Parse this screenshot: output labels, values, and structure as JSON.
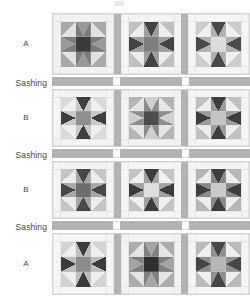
{
  "diagram": {
    "labels": {
      "row_a": "A",
      "row_b": "B",
      "sashing": "Sashing"
    },
    "rows": [
      {
        "type": "block",
        "label": "A",
        "blocks": 3
      },
      {
        "type": "sashing",
        "label": "Sashing",
        "cornerstones": 2
      },
      {
        "type": "block",
        "label": "B",
        "blocks": 3
      },
      {
        "type": "sashing",
        "label": "Sashing",
        "cornerstones": 2
      },
      {
        "type": "block",
        "label": "B",
        "blocks": 3
      },
      {
        "type": "sashing",
        "label": "Sashing",
        "cornerstones": 2
      },
      {
        "type": "block",
        "label": "A",
        "blocks": 3
      }
    ],
    "colors": {
      "sashing": "#b3b3b3",
      "cornerstone": "#ffffff",
      "background": "#ffffff",
      "outline": "#d2d2d2",
      "label_text": "#4a4a4a",
      "very_dark": "#3a3a3a",
      "dark": "#4f4f4f",
      "medium_dark": "#6e6e6e",
      "medium": "#8a8a8a",
      "medium_light": "#a8a8a8",
      "light": "#c6c6c6",
      "very_light": "#dedede",
      "near_white": "#efefef"
    },
    "block_structure": {
      "grid": "4x4 nine-patch star",
      "parts": [
        "center-square",
        "star-points",
        "corner-squares",
        "background-triangles"
      ]
    },
    "block_palettes": [
      {
        "row": "A",
        "index": 0,
        "center": "#3a3a3a",
        "points": "#7b7b7b",
        "corners": "#e2e2e2",
        "bg": "#f2f2f2",
        "accent": "#9a9a9a"
      },
      {
        "row": "A",
        "index": 1,
        "center": "#7e7e7e",
        "points": "#9d9d9d",
        "corners": "#ededed",
        "bg": "#f4f4f4",
        "accent": "#434343"
      },
      {
        "row": "A",
        "index": 2,
        "center": "#dcdcdc",
        "points": "#b0b0b0",
        "corners": "#f0f0f0",
        "bg": "#f6f6f6",
        "accent": "#4a4a4a"
      },
      {
        "row": "B",
        "index": 0,
        "center": "#8f8f8f",
        "points": "#c9c9c9",
        "corners": "#efefef",
        "bg": "#f4f4f4",
        "accent": "#3f3f3f"
      },
      {
        "row": "B",
        "index": 1,
        "center": "#4c4c4c",
        "points": "#8d8d8d",
        "corners": "#e6e6e6",
        "bg": "#f2f2f2",
        "accent": "#cfcfcf"
      },
      {
        "row": "B",
        "index": 2,
        "center": "#c4c4c4",
        "points": "#9b9b9b",
        "corners": "#ededed",
        "bg": "#f5f5f5",
        "accent": "#3d3d3d"
      },
      {
        "row": "B2",
        "index": 0,
        "center": "#6d6d6d",
        "points": "#a6a6a6",
        "corners": "#ececec",
        "bg": "#f4f4f4",
        "accent": "#474747"
      },
      {
        "row": "B2",
        "index": 1,
        "center": "#dfdfdf",
        "points": "#a2a2a2",
        "corners": "#f0f0f0",
        "bg": "#f6f6f6",
        "accent": "#3c3c3c"
      },
      {
        "row": "B2",
        "index": 2,
        "center": "#cacaca",
        "points": "#888888",
        "corners": "#ededed",
        "bg": "#f4f4f4",
        "accent": "#3e3e3e"
      },
      {
        "row": "A2",
        "index": 0,
        "center": "#8b8b8b",
        "points": "#bdbdbd",
        "corners": "#eeeeee",
        "bg": "#f5f5f5",
        "accent": "#3b3b3b"
      },
      {
        "row": "A2",
        "index": 1,
        "center": "#2f2f2f",
        "points": "#7f7f7f",
        "corners": "#e4e4e4",
        "bg": "#f2f2f2",
        "accent": "#a5a5a5"
      },
      {
        "row": "A2",
        "index": 2,
        "center": "#b6b6b6",
        "points": "#8f8f8f",
        "corners": "#efefef",
        "bg": "#f5f5f5",
        "accent": "#474747"
      }
    ]
  }
}
